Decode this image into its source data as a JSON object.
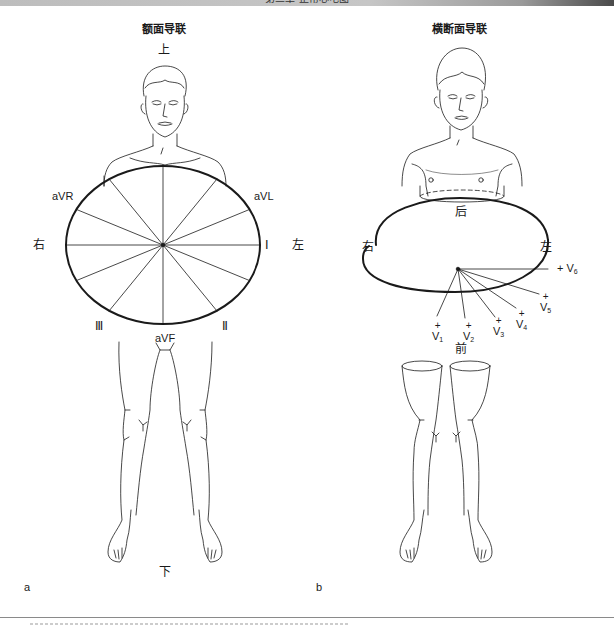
{
  "header": {
    "running_title": "第三章  正常心电图"
  },
  "panel_a": {
    "letter": "a",
    "title": "额面导联",
    "directions": {
      "top": "上",
      "bottom": "下",
      "right_side": "右",
      "left_side": "左"
    },
    "leads": {
      "aVR": "aVR",
      "aVL": "aVL",
      "I": "Ⅰ",
      "II": "Ⅱ",
      "III": "Ⅲ",
      "aVF": "aVF"
    }
  },
  "panel_b": {
    "letter": "b",
    "title": "横断面导联",
    "directions": {
      "back": "后",
      "front": "前",
      "right_side": "右",
      "left_side": "左"
    },
    "leads": [
      {
        "id": "V1",
        "name": "V",
        "sub": "1",
        "sign": "+"
      },
      {
        "id": "V2",
        "name": "V",
        "sub": "2",
        "sign": "+"
      },
      {
        "id": "V3",
        "name": "V",
        "sub": "3",
        "sign": "+"
      },
      {
        "id": "V4",
        "name": "V",
        "sub": "4",
        "sign": "+"
      },
      {
        "id": "V5",
        "name": "V",
        "sub": "5",
        "sign": "+"
      },
      {
        "id": "V6",
        "name": "V",
        "sub": "6",
        "sign": "+"
      }
    ]
  },
  "colors": {
    "line": "#1a1a1a",
    "header_bar_dark": "#4a4a4a",
    "header_bar_light": "#c6c6c6"
  }
}
